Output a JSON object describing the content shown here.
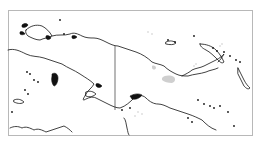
{
  "map": {
    "region": "New Guinea",
    "width": 262,
    "height": 143,
    "colors": {
      "background": "#ffffff",
      "frame": "#b8b8b8",
      "coastline": "#111111",
      "border": "#333333",
      "highlight": "#cfcfcf"
    },
    "frame": {
      "x": 8,
      "y": 10,
      "w": 244,
      "h": 125
    },
    "international_border": {
      "x1": 115,
      "y1": 46,
      "x2": 115,
      "y2": 110
    },
    "coastlines": [
      "M8,50 C14,48 20,51 26,54 C32,57 38,56 44,58 C50,60 56,62 62,64 C68,68 74,70 80,74 C86,78 90,80 94,84 C92,88 88,90 86,94 C84,98 82,100 84,100 C88,98 92,96 96,98 C100,100 104,102 108,104 C112,106 116,108 120,108 C126,106 130,102 134,98 C138,96 142,94 146,98 C150,102 154,104 158,104 C162,104 166,106 170,108 C176,110 182,112 188,114 C194,116 198,118 202,120 C206,124 210,128 216,130",
      "M26,30 C30,26 36,24 42,26 C46,28 50,32 52,36 C48,38 44,38 40,40 C36,40 32,38 28,36 C26,34 25,32 26,30 Z",
      "M52,36 C58,34 64,36 70,34 C74,32 78,34 82,36 C86,38 90,38 94,38 C98,38 102,40 106,42 C110,44 114,46 118,46 C124,48 130,50 136,52 C142,54 148,58 152,62 C156,64 160,64 164,66 C168,70 172,72 176,74 C180,76 184,76 188,76 C194,74 200,74 206,72 C210,70 214,70 218,68",
      "M182,76 C186,74 190,72 192,70 C196,68 200,68 204,66 C208,64 212,62 216,60 C220,58 222,56 224,54 C222,58 220,60 218,62",
      "M200,44 C206,44 212,46 216,50 C220,54 222,58 224,62 C222,64 220,62 218,60 C214,56 210,52 206,50 C202,48 200,46 200,44 Z",
      "M166,42 C170,40 174,41 176,43 C174,45 170,45 166,44 Z",
      "M238,68 C240,72 242,76 244,80 C246,84 248,86 250,88 C248,90 246,88 244,86 C242,82 240,78 238,74 Z",
      "M14,100 C18,98 22,100 24,102 C22,104 18,104 14,102 Z",
      "M10,128 C14,126 18,126 22,128 C26,126 30,128 34,130 C38,128 42,130 46,132 C52,130 58,128 64,126 C68,128 70,130 72,132",
      "M86,92 C90,90 94,92 96,94 C94,96 90,98 86,96 Z",
      "M124,118 C126,120 126,124 127,128 C128,132 128,134 129,135"
    ],
    "filled_shapes": [
      "M52,74 C55,72 58,74 58,78 C58,82 56,86 54,86 C52,84 51,80 52,76 Z",
      "M130,96 C134,94 138,93 142,95 C140,98 136,100 132,99 Z",
      "M96,84 C98,83 100,84 102,86 C100,88 98,88 96,86 Z",
      "M22,25 C24,23 27,23 28,25 C27,27 24,28 22,27 Z",
      "M20,32 C22,31 24,32 25,34 C23,35 21,35 20,34 Z",
      "M46,36 C48,35 50,36 51,38 C49,40 47,40 46,38 Z",
      "M72,36 C74,35 76,36 77,37 C75,39 73,39 72,38 Z"
    ],
    "highlight_regions": [
      "M162,78 C165,75 170,75 174,77 C176,79 175,82 172,83 C168,83 164,82 162,80 Z",
      "M152,66 C154,65 156,66 156,68 C155,70 153,70 152,68 Z"
    ],
    "islands": [
      [
        168,
        40
      ],
      [
        175,
        42
      ],
      [
        194,
        36
      ],
      [
        213,
        48
      ],
      [
        217,
        51
      ],
      [
        224,
        52
      ],
      [
        230,
        56
      ],
      [
        236,
        60
      ],
      [
        240,
        62
      ],
      [
        198,
        100
      ],
      [
        204,
        104
      ],
      [
        210,
        106
      ],
      [
        214,
        108
      ],
      [
        220,
        106
      ],
      [
        228,
        112
      ],
      [
        234,
        126
      ],
      [
        27,
        72
      ],
      [
        30,
        74
      ],
      [
        34,
        80
      ],
      [
        38,
        82
      ],
      [
        25,
        90
      ],
      [
        28,
        94
      ],
      [
        60,
        20
      ],
      [
        64,
        34
      ],
      [
        12,
        112
      ],
      [
        130,
        108
      ],
      [
        122,
        110
      ],
      [
        188,
        118
      ],
      [
        192,
        122
      ]
    ],
    "faint_dots": [
      [
        148,
        32
      ],
      [
        152,
        34
      ],
      [
        196,
        64
      ],
      [
        194,
        66
      ],
      [
        138,
        112
      ],
      [
        142,
        114
      ],
      [
        135,
        116
      ],
      [
        220,
        46
      ],
      [
        222,
        44
      ]
    ]
  }
}
